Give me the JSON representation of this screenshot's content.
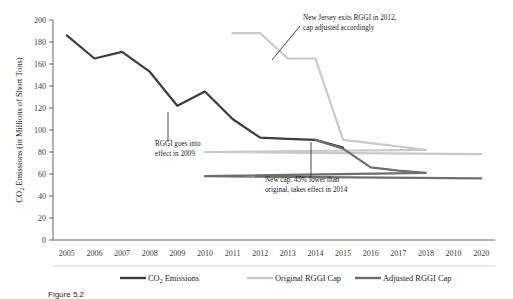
{
  "chart_data": {
    "type": "line",
    "title": "",
    "xlabel": "",
    "ylabel": "CO2 Emissions (in Millions of Short Tons)",
    "ylabel_parts": {
      "prefix": "CO",
      "sub": "2",
      "suffix": " Emissions (in Millions of Short Tons)"
    },
    "categories": [
      "2005",
      "2006",
      "2007",
      "2008",
      "2009",
      "2010",
      "2011",
      "2012",
      "2013",
      "2014",
      "2015",
      "2016",
      "2017",
      "2018",
      "2010",
      "2020"
    ],
    "xtick_labels": [
      "2005",
      "2006",
      "2007",
      "2008",
      "2009",
      "2010",
      "2011",
      "2012",
      "2013",
      "2014",
      "2015",
      "2016",
      "2017",
      "2018",
      "2010",
      "2020"
    ],
    "ytick_labels": [
      "0",
      "20",
      "40",
      "60",
      "80",
      "100",
      "120",
      "140",
      "160",
      "180",
      "200"
    ],
    "ylim": [
      0,
      200
    ],
    "ytick_step": 20,
    "grid": false,
    "legend_position": "bottom",
    "series": [
      {
        "name": "CO2 Emissions",
        "name_prefix": "CO",
        "name_sub": "2",
        "name_suffix": " Emissions",
        "color": "#3d3d3d",
        "width": 2.2,
        "x": [
          "2005",
          "2006",
          "2007",
          "2008",
          "2009",
          "2010",
          "2011",
          "2012",
          "2013",
          "2014",
          "2015"
        ],
        "values": [
          186,
          165,
          171,
          153,
          122,
          135,
          110,
          93,
          92,
          91,
          84
        ]
      },
      {
        "name": "Original RGGI Cap",
        "color": "#c9c9c9",
        "width": 2.2,
        "x": [
          "2011",
          "2012",
          "2013",
          "2014",
          "2015",
          "2016",
          "2017",
          "2018",
          "2010",
          "2020"
        ],
        "values": [
          188,
          188,
          165,
          165,
          91,
          88,
          85,
          82,
          80,
          78
        ]
      },
      {
        "name": "Adjusted RGGI Cap",
        "color": "#6e6e6e",
        "width": 2.2,
        "x": [
          "2014",
          "2015",
          "2016",
          "2017",
          "2018",
          "2010",
          "2020"
        ],
        "values": [
          91,
          83,
          66,
          63,
          61,
          58,
          56
        ]
      }
    ],
    "annotations": [
      {
        "id": "rggi-effect",
        "lines": [
          "RGGI goes into",
          "effect in 2009"
        ],
        "target_x": "2009",
        "target_y": 122
      },
      {
        "id": "nj-exit",
        "lines": [
          "New Jersey exits RGGI in 2012,",
          "cap adjusted accordingly"
        ],
        "target_x": "2013",
        "target_y": 165
      },
      {
        "id": "new-cap",
        "lines": [
          "New cap, 45% lower than",
          "original, takes effect in 2014"
        ],
        "target_x": "2014",
        "target_y": 91
      }
    ]
  },
  "legend": {
    "items": [
      {
        "label": "CO2 Emissions",
        "color": "#3d3d3d"
      },
      {
        "label": "Original RGGI Cap",
        "color": "#c9c9c9"
      },
      {
        "label": "Adjusted RGGI Cap",
        "color": "#6e6e6e"
      }
    ]
  },
  "caption": {
    "text": "Figure 5.2"
  }
}
